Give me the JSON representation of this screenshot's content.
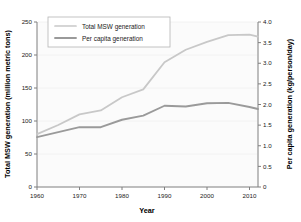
{
  "chart_data": {
    "type": "line",
    "title": "",
    "xlabel": "Year",
    "ylabel": "Total MSW generation (million metric tons)",
    "y2label": "Per capita generation (kg/person/day)",
    "xlim": [
      1960,
      2012
    ],
    "ylim": [
      0,
      250
    ],
    "y2lim": [
      0,
      4.0
    ],
    "grid": true,
    "legend_position": "top-left",
    "xticks": [
      1960,
      1970,
      1980,
      1990,
      2000,
      2010
    ],
    "xticklabels": [
      "1960",
      "1970",
      "1980",
      "1990",
      "2000",
      "2010"
    ],
    "yticks": [
      0,
      50,
      100,
      150,
      200,
      250
    ],
    "yticklabels": [
      "0",
      "50",
      "100",
      "150",
      "200",
      "250"
    ],
    "y2ticks": [
      0,
      0.5,
      1.0,
      1.5,
      2.0,
      2.5,
      3.0,
      3.5,
      4.0
    ],
    "y2ticklabels": [
      "0",
      "0.5",
      "1.0",
      "1.5",
      "2.0",
      "2.5",
      "3.0",
      "3.5",
      "4.0"
    ],
    "x": [
      1960,
      1965,
      1970,
      1975,
      1980,
      1985,
      1990,
      1995,
      2000,
      2005,
      2010,
      2012
    ],
    "series": [
      {
        "name": "Total MSW generation",
        "axis": "left",
        "color": "#c8c8c8",
        "values": [
          80,
          94,
          110,
          116,
          136,
          148,
          189,
          208,
          220,
          230,
          231,
          228
        ]
      },
      {
        "name": "Per capita generation",
        "axis": "right",
        "color": "#9a9a9a",
        "values": [
          1.21,
          1.33,
          1.45,
          1.45,
          1.63,
          1.73,
          1.97,
          1.95,
          2.03,
          2.04,
          1.94,
          1.89
        ]
      }
    ]
  },
  "legend": {
    "entries": [
      {
        "label": "Total MSW generation",
        "color": "#c8c8c8"
      },
      {
        "label": "Per capita generation",
        "color": "#9a9a9a"
      }
    ]
  },
  "axes": {
    "x_title": "Year",
    "y_left_title": "Total MSW generation (million metric tons)",
    "y_right_title": "Per capita generation (kg/person/day)"
  }
}
